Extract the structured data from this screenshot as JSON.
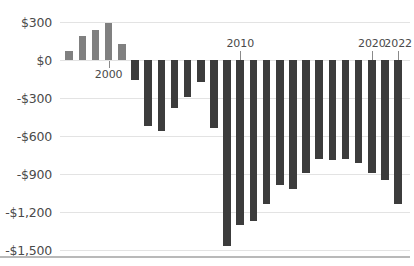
{
  "chart_data": {
    "type": "bar",
    "title": "",
    "subtitle": "",
    "xlabel": "",
    "ylabel": "",
    "ylim": [
      -1500,
      300
    ],
    "grid": true,
    "legend": "none",
    "y_ticks": [
      "$300",
      "$0",
      "-$300",
      "-$600",
      "-$900",
      "-$1,200",
      "-$1,500"
    ],
    "y_tick_values": [
      300,
      0,
      -300,
      -600,
      -900,
      -1200,
      -1500
    ],
    "x_tick_labels": [
      "2000",
      "2010",
      "2020",
      "2022"
    ],
    "x_tick_indices": [
      3,
      13,
      23,
      25
    ],
    "colors": {
      "positive_bar": "#808080",
      "negative_bar": "#3c3c3c",
      "gridline": "#e3e3e3",
      "axis": "#b9b9b9",
      "text": "#4a4a4a",
      "background": "#ffffff"
    },
    "categories": [
      "1997",
      "1998",
      "1999",
      "2000",
      "2001",
      "2002",
      "2003",
      "2004",
      "2005",
      "2006",
      "2007",
      "2008",
      "2009",
      "2010",
      "2011",
      "2012",
      "2013",
      "2014",
      "2015",
      "2016",
      "2017",
      "2018",
      "2019",
      "2020",
      "2021",
      "2022"
    ],
    "values": [
      70,
      190,
      240,
      290,
      130,
      -160,
      -520,
      -560,
      -380,
      -290,
      -170,
      -540,
      -1470,
      -1300,
      -1270,
      -1140,
      -990,
      -1020,
      -890,
      -780,
      -790,
      -780,
      -810,
      -890,
      -950,
      -1140
    ]
  }
}
